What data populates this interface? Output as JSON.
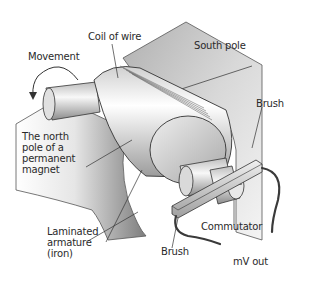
{
  "diagram": {
    "labels": {
      "coil": "Coil of wire",
      "movement": "Movement",
      "south_pole": "South pole",
      "brush_top": "Brush",
      "north_pole": "The north\npole of a\npermanent\nmagnet",
      "armature": "Laminated\narmature\n(iron)",
      "commutator": "Commutator",
      "brush_bottom": "Brush",
      "output": "mV out"
    },
    "colors": {
      "outline": "#333333",
      "label": "#2a2a2a",
      "pole_dark": "#8a8a8a",
      "pole_light": "#f2f2f2",
      "metal": "#d9d9d9"
    }
  }
}
